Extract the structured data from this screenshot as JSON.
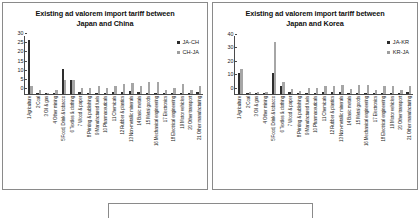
{
  "figure": {
    "panel_count": 2
  },
  "charts": [
    {
      "title_line1": "Existing ad valorem import tariff between",
      "title_line2": "Japan and China",
      "legend": [
        {
          "label": "JA-CH",
          "color": "#2e2e2e"
        },
        {
          "label": "CH-JA",
          "color": "#a6a6a6"
        }
      ],
      "yticks": [
        0,
        5,
        10,
        15,
        20,
        25,
        30
      ],
      "chart_data": {
        "type": "bar",
        "title": "Existing ad valorem import tariff between Japan and China",
        "xlabel": "",
        "ylabel": "",
        "ylim": [
          0,
          32
        ],
        "grid": false,
        "legend_position": "top-right",
        "categories": [
          "1 Agriculture",
          "2 Coal",
          "3 Oil & gas",
          "4 Other mining",
          "5 Food, Drink & tobacco",
          "6 Textiles & clothing",
          "7 Wood & paper",
          "8 Printing & publishing",
          "9 Manufactured fuels",
          "10 Pharmaceuticals",
          "11 Chemicals",
          "12 Rubber & plastics",
          "13 Non-metallic minerals",
          "14 Basic metals",
          "15 Metal goods",
          "16 Mechanical engineering",
          "17 Electronics",
          "18 Electrical engineering",
          "19 Motor vehicles",
          "20 Other transport",
          "21 Other manufacturing"
        ],
        "series": [
          {
            "name": "JA-CH",
            "values": [
              29.5,
              0.4,
              0.2,
              0.4,
              13.8,
              7.5,
              1.0,
              0.2,
              0.6,
              0.2,
              1.0,
              1.0,
              1.3,
              0.9,
              0.6,
              0.2,
              0.2,
              0.2,
              0.2,
              0.2,
              1.1
            ]
          },
          {
            "name": "CH-JA",
            "values": [
              4.0,
              2.3,
              0.5,
              2.0,
              7.3,
              7.5,
              3.4,
              3.0,
              4.0,
              3.4,
              4.2,
              5.5,
              6.0,
              4.0,
              6.6,
              6.3,
              2.0,
              3.0,
              5.5,
              2.0,
              4.4
            ]
          }
        ]
      }
    },
    {
      "title_line1": "Existing ad valorem import tariff between",
      "title_line2": "Japan and Korea",
      "legend": [
        {
          "label": "JA-KR",
          "color": "#2e2e2e"
        },
        {
          "label": "KR-JA",
          "color": "#a6a6a6"
        }
      ],
      "yticks": [
        0,
        10,
        20,
        30,
        40
      ],
      "chart_data": {
        "type": "bar",
        "title": "Existing ad valorem import tariff between Japan and Korea",
        "xlabel": "",
        "ylabel": "",
        "ylim": [
          0,
          43
        ],
        "grid": false,
        "legend_position": "top-right",
        "categories": [
          "1 Agriculture",
          "2 Coal",
          "3 Oil & gas",
          "4 Other mining",
          "5 Food, Drink & tobacco",
          "6 Textiles & clothing",
          "7 Wood & paper",
          "8 Printing & publishing",
          "9 Manufactured fuels",
          "10 Pharmaceuticals",
          "11 Chemicals",
          "12 Rubber & plastics",
          "13 Non-metallic minerals",
          "14 Basic metals",
          "15 Metal goods",
          "16 Mechanical engineering",
          "17 Electronics",
          "18 Electrical engineering",
          "19 Motor vehicles",
          "20 Other transport",
          "21 Other manufacturing"
        ],
        "series": [
          {
            "name": "JA-KR",
            "values": [
              15.5,
              0.5,
              0.5,
              0.5,
              15.0,
              5.5,
              1.0,
              0.3,
              0.8,
              0.3,
              1.2,
              1.0,
              1.2,
              0.8,
              0.5,
              0.3,
              0.3,
              0.3,
              0.3,
              0.3,
              1.0
            ]
          },
          {
            "name": "KR-JA",
            "values": [
              18.5,
              1.5,
              1.5,
              1.5,
              38.0,
              9.0,
              3.5,
              2.0,
              4.0,
              4.0,
              5.5,
              6.0,
              6.5,
              3.5,
              6.5,
              6.5,
              3.0,
              6.0,
              6.0,
              3.0,
              6.0
            ]
          }
        ]
      }
    }
  ]
}
